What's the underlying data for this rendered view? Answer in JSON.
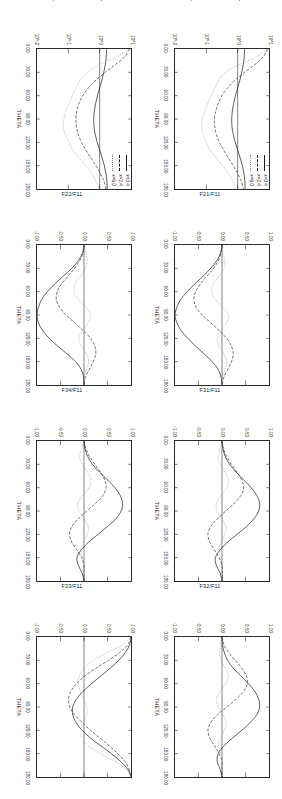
{
  "figure": {
    "xaxis": {
      "label": "THETA",
      "ticks": [
        "0.00",
        "30.00",
        "60.00",
        "90.00",
        "120.00",
        "150.00",
        "180.00"
      ],
      "min": 0,
      "max": 180
    },
    "legend": {
      "entries": [
        {
          "label": "x=0.4",
          "style": "solid"
        },
        {
          "label": "x=2.4",
          "style": "dashed"
        },
        {
          "label": "x=6.0",
          "style": "dotted"
        }
      ]
    },
    "panels": [
      {
        "id": "phase-function-top",
        "ylabel": "LOG(PHASE FUNCTION)",
        "yticks": [
          "10^-2",
          "10^-1",
          "10^0",
          "10^1"
        ],
        "ymin": -2,
        "ymax": 1,
        "has_legend": true
      },
      {
        "id": "f21-f11-top",
        "ylabel": "F21/F11",
        "yticks": [
          "-1.00",
          "-0.50",
          "0.00",
          "0.50",
          "1.00"
        ],
        "ymin": -1,
        "ymax": 1,
        "has_legend": false
      },
      {
        "id": "f31-f11-top",
        "ylabel": "F31/F11",
        "yticks": [
          "-1.00",
          "-0.50",
          "0.00",
          "0.50",
          "1.00"
        ],
        "ymin": -1,
        "ymax": 1,
        "has_legend": false
      },
      {
        "id": "f32-f11-top",
        "ylabel": "F32/F11",
        "yticks": [
          "-1.00",
          "-0.50",
          "0.00",
          "0.50",
          "1.00"
        ],
        "ymin": -1,
        "ymax": 1,
        "has_legend": false
      },
      {
        "id": "phase-function-bottom",
        "ylabel": "LOG(PHASE FUNCTION)",
        "yticks": [
          "10^-2",
          "10^-1",
          "10^0",
          "10^1"
        ],
        "ymin": -2,
        "ymax": 1,
        "has_legend": true
      },
      {
        "id": "f22-f11-bottom",
        "ylabel": "F22/F11",
        "yticks": [
          "-1.00",
          "-0.50",
          "0.00",
          "0.50",
          "1.00"
        ],
        "ymin": -1,
        "ymax": 1,
        "has_legend": false
      },
      {
        "id": "f34-f11-bottom",
        "ylabel": "F34/F11",
        "yticks": [
          "-1.00",
          "-0.50",
          "0.00",
          "0.50",
          "1.00"
        ],
        "ymin": -1,
        "ymax": 1,
        "has_legend": false
      },
      {
        "id": "f33-f11-bottom",
        "ylabel": "F33/F11",
        "yticks": [
          "-1.00",
          "-0.50",
          "0.00",
          "0.50",
          "1.00"
        ],
        "ymin": -1,
        "ymax": 1,
        "has_legend": false
      }
    ]
  },
  "chart_data": [
    {
      "type": "line",
      "title": "",
      "xlabel": "THETA",
      "ylabel": "LOG(PHASE FUNCTION)",
      "xlim": [
        0,
        180
      ],
      "ylim": [
        -2,
        1
      ],
      "grid": false,
      "legend_position": "top-right",
      "x": [
        0,
        10,
        20,
        30,
        40,
        50,
        60,
        70,
        80,
        90,
        100,
        110,
        120,
        130,
        140,
        150,
        160,
        170,
        180
      ],
      "series": [
        {
          "name": "x=0.4",
          "style": "solid",
          "values": [
            0.22,
            0.21,
            0.18,
            0.13,
            0.07,
            0.0,
            -0.07,
            -0.13,
            -0.17,
            -0.19,
            -0.18,
            -0.14,
            -0.08,
            0.0,
            0.08,
            0.15,
            0.2,
            0.23,
            0.24
          ]
        },
        {
          "name": "x=2.4",
          "style": "dashed",
          "values": [
            0.95,
            0.82,
            0.55,
            0.22,
            -0.08,
            -0.32,
            -0.5,
            -0.62,
            -0.7,
            -0.74,
            -0.73,
            -0.68,
            -0.58,
            -0.45,
            -0.3,
            -0.14,
            0.0,
            0.12,
            0.18
          ]
        },
        {
          "name": "x=6.0",
          "style": "dotted",
          "values": [
            1.0,
            0.6,
            0.05,
            -0.38,
            -0.6,
            -0.72,
            -0.85,
            -0.95,
            -1.05,
            -1.12,
            -1.15,
            -1.1,
            -1.0,
            -0.88,
            -0.7,
            -0.48,
            -0.3,
            -0.15,
            -0.05
          ]
        }
      ]
    },
    {
      "type": "line",
      "title": "",
      "xlabel": "THETA",
      "ylabel": "F21/F11",
      "xlim": [
        0,
        180
      ],
      "ylim": [
        -1,
        1
      ],
      "grid": false,
      "x": [
        0,
        10,
        20,
        30,
        40,
        50,
        60,
        70,
        80,
        90,
        100,
        110,
        120,
        130,
        140,
        150,
        160,
        170,
        180
      ],
      "series": [
        {
          "name": "x=0.4",
          "style": "solid",
          "values": [
            0.0,
            -0.03,
            -0.11,
            -0.24,
            -0.4,
            -0.58,
            -0.74,
            -0.88,
            -0.96,
            -1.0,
            -0.96,
            -0.87,
            -0.73,
            -0.56,
            -0.38,
            -0.21,
            -0.08,
            -0.02,
            0.0
          ]
        },
        {
          "name": "x=2.4",
          "style": "dashed",
          "values": [
            0.0,
            -0.02,
            -0.08,
            -0.18,
            -0.32,
            -0.46,
            -0.56,
            -0.6,
            -0.55,
            -0.42,
            -0.24,
            -0.06,
            0.1,
            0.2,
            0.24,
            0.2,
            0.12,
            0.04,
            0.0
          ]
        },
        {
          "name": "x=6.0",
          "style": "dotted",
          "values": [
            0.0,
            0.02,
            0.06,
            0.04,
            -0.06,
            -0.18,
            -0.22,
            -0.14,
            0.02,
            0.14,
            0.1,
            -0.02,
            -0.1,
            -0.06,
            0.04,
            0.1,
            0.06,
            0.01,
            0.0
          ]
        }
      ]
    },
    {
      "type": "line",
      "title": "",
      "xlabel": "THETA",
      "ylabel": "F31/F11",
      "xlim": [
        0,
        180
      ],
      "ylim": [
        -1,
        1
      ],
      "grid": false,
      "x": [
        0,
        10,
        20,
        30,
        40,
        50,
        60,
        70,
        80,
        90,
        100,
        110,
        120,
        130,
        140,
        150,
        160,
        170,
        180
      ],
      "series": [
        {
          "name": "x=0.4",
          "style": "solid",
          "values": [
            0.0,
            0.02,
            0.07,
            0.16,
            0.3,
            0.46,
            0.62,
            0.74,
            0.8,
            0.78,
            0.68,
            0.52,
            0.32,
            0.12,
            -0.04,
            -0.14,
            -0.12,
            -0.04,
            0.0
          ]
        },
        {
          "name": "x=2.4",
          "style": "dashed",
          "values": [
            0.0,
            0.03,
            0.1,
            0.2,
            0.32,
            0.42,
            0.46,
            0.4,
            0.26,
            0.08,
            -0.1,
            -0.24,
            -0.3,
            -0.26,
            -0.16,
            -0.06,
            0.0,
            0.01,
            0.0
          ]
        },
        {
          "name": "x=6.0",
          "style": "dotted",
          "values": [
            0.0,
            -0.04,
            -0.08,
            -0.04,
            0.06,
            0.14,
            0.1,
            -0.02,
            -0.12,
            -0.1,
            0.0,
            0.08,
            0.06,
            -0.02,
            -0.06,
            -0.03,
            0.0,
            0.0,
            0.0
          ]
        }
      ]
    },
    {
      "type": "line",
      "title": "",
      "xlabel": "THETA",
      "ylabel": "F32/F11",
      "xlim": [
        0,
        180
      ],
      "ylim": [
        -1,
        1
      ],
      "grid": false,
      "x": [
        0,
        10,
        20,
        30,
        40,
        50,
        60,
        70,
        80,
        90,
        100,
        110,
        120,
        130,
        140,
        150,
        160,
        170,
        180
      ],
      "series": [
        {
          "name": "x=0.4",
          "style": "solid",
          "values": [
            0.0,
            0.01,
            0.05,
            0.12,
            0.24,
            0.4,
            0.56,
            0.7,
            0.78,
            0.8,
            0.74,
            0.6,
            0.42,
            0.22,
            0.04,
            -0.08,
            -0.1,
            -0.04,
            0.0
          ]
        },
        {
          "name": "x=2.4",
          "style": "dashed",
          "values": [
            0.0,
            0.04,
            0.14,
            0.28,
            0.42,
            0.52,
            0.54,
            0.46,
            0.3,
            0.1,
            -0.1,
            -0.24,
            -0.3,
            -0.26,
            -0.16,
            -0.06,
            0.0,
            0.0,
            0.0
          ]
        },
        {
          "name": "x=6.0",
          "style": "dotted",
          "values": [
            0.0,
            -0.03,
            -0.06,
            -0.02,
            0.07,
            0.13,
            0.08,
            -0.04,
            -0.12,
            -0.08,
            0.02,
            0.09,
            0.05,
            -0.03,
            -0.07,
            -0.02,
            0.01,
            0.0,
            0.0
          ]
        }
      ]
    },
    {
      "type": "line",
      "title": "",
      "xlabel": "THETA",
      "ylabel": "LOG(PHASE FUNCTION)",
      "xlim": [
        0,
        180
      ],
      "ylim": [
        -2,
        1
      ],
      "grid": false,
      "legend_position": "top-right",
      "x": [
        0,
        10,
        20,
        30,
        40,
        50,
        60,
        70,
        80,
        90,
        100,
        110,
        120,
        130,
        140,
        150,
        160,
        170,
        180
      ],
      "series": [
        {
          "name": "x=0.4",
          "style": "solid",
          "values": [
            0.22,
            0.21,
            0.18,
            0.13,
            0.07,
            0.0,
            -0.07,
            -0.13,
            -0.17,
            -0.19,
            -0.18,
            -0.14,
            -0.08,
            0.0,
            0.08,
            0.15,
            0.2,
            0.23,
            0.24
          ]
        },
        {
          "name": "x=2.4",
          "style": "dashed",
          "values": [
            0.95,
            0.8,
            0.5,
            0.18,
            -0.12,
            -0.36,
            -0.54,
            -0.66,
            -0.73,
            -0.76,
            -0.74,
            -0.68,
            -0.58,
            -0.44,
            -0.28,
            -0.12,
            0.02,
            0.14,
            0.2
          ]
        },
        {
          "name": "x=6.0",
          "style": "dotted",
          "values": [
            1.0,
            0.55,
            0.0,
            -0.4,
            -0.62,
            -0.75,
            -0.88,
            -0.98,
            -1.08,
            -1.14,
            -1.16,
            -1.1,
            -0.98,
            -0.85,
            -0.66,
            -0.44,
            -0.26,
            -0.12,
            -0.02
          ]
        }
      ]
    },
    {
      "type": "line",
      "title": "",
      "xlabel": "THETA",
      "ylabel": "F22/F11",
      "xlim": [
        0,
        180
      ],
      "ylim": [
        -1,
        1
      ],
      "grid": false,
      "x": [
        0,
        10,
        20,
        30,
        40,
        50,
        60,
        70,
        80,
        90,
        100,
        110,
        120,
        130,
        140,
        150,
        160,
        170,
        180
      ],
      "series": [
        {
          "name": "x=0.4",
          "style": "solid",
          "values": [
            0.0,
            -0.03,
            -0.12,
            -0.26,
            -0.44,
            -0.62,
            -0.78,
            -0.9,
            -0.97,
            -1.0,
            -0.97,
            -0.88,
            -0.74,
            -0.56,
            -0.36,
            -0.18,
            -0.06,
            -0.01,
            0.0
          ]
        },
        {
          "name": "x=2.4",
          "style": "dashed",
          "values": [
            0.0,
            -0.02,
            -0.09,
            -0.2,
            -0.34,
            -0.48,
            -0.57,
            -0.59,
            -0.52,
            -0.38,
            -0.2,
            -0.02,
            0.14,
            0.23,
            0.25,
            0.2,
            0.11,
            0.03,
            0.0
          ]
        },
        {
          "name": "x=6.0",
          "style": "dotted",
          "values": [
            0.0,
            0.03,
            0.07,
            0.03,
            -0.07,
            -0.19,
            -0.21,
            -0.12,
            0.04,
            0.15,
            0.09,
            -0.03,
            -0.11,
            -0.05,
            0.05,
            0.1,
            0.05,
            0.01,
            0.0
          ]
        }
      ]
    },
    {
      "type": "line",
      "title": "",
      "xlabel": "THETA",
      "ylabel": "F34/F11",
      "xlim": [
        0,
        180
      ],
      "ylim": [
        -1,
        1
      ],
      "grid": false,
      "x": [
        0,
        10,
        20,
        30,
        40,
        50,
        60,
        70,
        80,
        90,
        100,
        110,
        120,
        130,
        140,
        150,
        160,
        170,
        180
      ],
      "series": [
        {
          "name": "x=0.4",
          "style": "solid",
          "values": [
            0.0,
            0.02,
            0.08,
            0.18,
            0.33,
            0.5,
            0.66,
            0.77,
            0.82,
            0.79,
            0.68,
            0.5,
            0.3,
            0.1,
            -0.06,
            -0.15,
            -0.12,
            -0.04,
            0.0
          ]
        },
        {
          "name": "x=2.4",
          "style": "dashed",
          "values": [
            0.0,
            0.04,
            0.12,
            0.23,
            0.35,
            0.44,
            0.47,
            0.4,
            0.25,
            0.06,
            -0.12,
            -0.26,
            -0.31,
            -0.26,
            -0.15,
            -0.05,
            0.0,
            0.0,
            0.0
          ]
        },
        {
          "name": "x=6.0",
          "style": "dotted",
          "values": [
            0.0,
            -0.05,
            -0.09,
            -0.04,
            0.07,
            0.15,
            0.11,
            -0.02,
            -0.13,
            -0.11,
            0.0,
            0.09,
            0.07,
            -0.02,
            -0.07,
            -0.03,
            0.0,
            0.0,
            0.0
          ]
        }
      ]
    },
    {
      "type": "line",
      "title": "",
      "xlabel": "THETA",
      "ylabel": "F33/F11",
      "xlim": [
        0,
        180
      ],
      "ylim": [
        -1,
        1
      ],
      "grid": false,
      "x": [
        0,
        10,
        20,
        30,
        40,
        50,
        60,
        70,
        80,
        90,
        100,
        110,
        120,
        130,
        140,
        150,
        160,
        170,
        180
      ],
      "series": [
        {
          "name": "x=0.4",
          "style": "solid",
          "values": [
            1.0,
            0.97,
            0.88,
            0.74,
            0.56,
            0.36,
            0.16,
            -0.02,
            -0.16,
            -0.24,
            -0.24,
            -0.17,
            -0.04,
            0.14,
            0.36,
            0.58,
            0.78,
            0.93,
            1.0
          ]
        },
        {
          "name": "x=2.4",
          "style": "dashed",
          "values": [
            1.0,
            0.93,
            0.76,
            0.52,
            0.26,
            0.02,
            -0.16,
            -0.28,
            -0.33,
            -0.3,
            -0.2,
            -0.04,
            0.14,
            0.34,
            0.54,
            0.72,
            0.87,
            0.96,
            1.0
          ]
        },
        {
          "name": "x=6.0",
          "style": "dotted",
          "values": [
            1.0,
            0.82,
            0.5,
            0.2,
            0.0,
            -0.1,
            -0.12,
            -0.08,
            0.0,
            0.06,
            0.06,
            0.0,
            -0.06,
            -0.04,
            0.1,
            0.35,
            0.66,
            0.9,
            1.0
          ]
        }
      ]
    }
  ]
}
